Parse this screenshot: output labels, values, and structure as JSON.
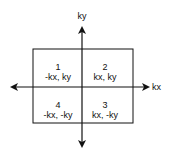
{
  "axes": {
    "y_label": "ky",
    "x_label": "kx"
  },
  "quadrants": [
    {
      "number": "1",
      "coords": "-kx, ky"
    },
    {
      "number": "2",
      "coords": "kx, ky"
    },
    {
      "number": "3",
      "coords": "kx, -ky"
    },
    {
      "number": "4",
      "coords": "-kx, -ky"
    }
  ],
  "colors": {
    "stroke": "#111111",
    "background": "#ffffff"
  }
}
